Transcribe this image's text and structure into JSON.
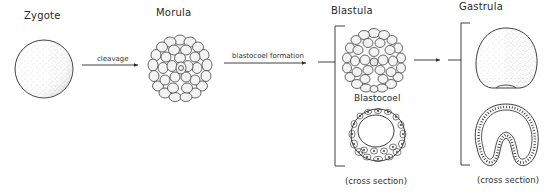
{
  "diagram": {
    "stages": [
      {
        "id": "zygote",
        "title": "Zygote"
      },
      {
        "id": "morula",
        "title": "Morula"
      },
      {
        "id": "blastula",
        "title": "Blastula",
        "sub_label": "Blastocoel",
        "caption": "(cross section)"
      },
      {
        "id": "gastrula",
        "title": "Gastrula",
        "caption": "(cross section)"
      }
    ],
    "transitions": [
      {
        "from": "zygote",
        "to": "morula",
        "label": "cleavage"
      },
      {
        "from": "morula",
        "to": "blastula",
        "label": "blastocoel formation"
      },
      {
        "from": "blastula",
        "to": "gastrula",
        "label": ""
      }
    ],
    "colors": {
      "ink": "#2a2a2a",
      "background": "#ffffff",
      "stipple": "#555555"
    }
  }
}
